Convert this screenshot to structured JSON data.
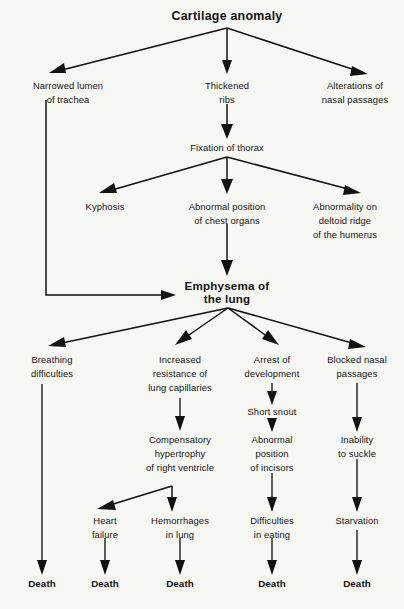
{
  "diagram": {
    "title": "Cartilage anomaly",
    "type": "flowchart",
    "orientation": "top-down",
    "background_color": "#f7f7f4",
    "line_color": "#121212",
    "text_color": "#121212",
    "nodes": [
      {
        "id": "cartilage_anomaly",
        "label": "Cartilage anomaly",
        "lines": [
          "Cartilage anomaly"
        ],
        "style": "bold-title",
        "x": 227,
        "y": 16,
        "level": 0
      },
      {
        "id": "narrowed_lumen",
        "label": "Narrowed lumen of trachea",
        "lines": [
          "Narrowed lumen",
          "of trachea"
        ],
        "style": "plain",
        "x": 68,
        "y": 86,
        "level": 1
      },
      {
        "id": "thickened_ribs",
        "label": "Thickened ribs",
        "lines": [
          "Thickened",
          "ribs"
        ],
        "style": "plain",
        "x": 227,
        "y": 86,
        "level": 1
      },
      {
        "id": "alterations_nasal",
        "label": "Alterations of nasal passages",
        "lines": [
          "Alterations of",
          "nasal passages"
        ],
        "style": "plain",
        "x": 355,
        "y": 86,
        "level": 1
      },
      {
        "id": "fixation_thorax",
        "label": "Fixation of thorax",
        "lines": [
          "Fixation of thorax"
        ],
        "style": "plain",
        "x": 227,
        "y": 148,
        "level": 2
      },
      {
        "id": "kyphosis",
        "label": "Kyphosis",
        "lines": [
          "Kyphosis"
        ],
        "style": "plain",
        "x": 105,
        "y": 207,
        "level": 3
      },
      {
        "id": "abnormal_position_chest",
        "label": "Abnormal position of chest organs",
        "lines": [
          "Abnormal position",
          "of chest organs"
        ],
        "style": "plain",
        "x": 227,
        "y": 207,
        "level": 3
      },
      {
        "id": "abnormality_deltoid",
        "label": "Abnormality on deltoid ridge of the humerus",
        "lines": [
          "Abnormality on",
          "deltoid ridge",
          "of the humerus"
        ],
        "style": "plain",
        "x": 345,
        "y": 207,
        "level": 3
      },
      {
        "id": "emphysema_lung",
        "label": "Emphysema of the lung",
        "lines": [
          "Emphysema of",
          "the lung"
        ],
        "style": "bold",
        "x": 227,
        "y": 286,
        "level": 4
      },
      {
        "id": "breathing_difficulties",
        "label": "Breathing difficulties",
        "lines": [
          "Breathing",
          "difficulties"
        ],
        "style": "plain",
        "x": 52,
        "y": 360,
        "level": 5
      },
      {
        "id": "increased_resistance",
        "label": "Increased resistance of lung capillaries",
        "lines": [
          "Increased",
          "resistance of",
          "lung capillaries"
        ],
        "style": "plain",
        "x": 180,
        "y": 360,
        "level": 5
      },
      {
        "id": "arrest_development",
        "label": "Arrest of development",
        "lines": [
          "Arrest of",
          "development"
        ],
        "style": "plain",
        "x": 272,
        "y": 360,
        "level": 5
      },
      {
        "id": "blocked_nasal",
        "label": "Blocked nasal passages",
        "lines": [
          "Blocked nasal",
          "passages"
        ],
        "style": "plain",
        "x": 357,
        "y": 360,
        "level": 5
      },
      {
        "id": "short_snout",
        "label": "Short snout",
        "lines": [
          "Short snout"
        ],
        "style": "plain",
        "x": 272,
        "y": 412,
        "level": 6
      },
      {
        "id": "compensatory_hypertrophy",
        "label": "Compensatory hypertrophy of right ventricle",
        "lines": [
          "Compensatory",
          "hypertrophy",
          "of right ventricle"
        ],
        "style": "plain",
        "x": 180,
        "y": 440,
        "level": 7
      },
      {
        "id": "abnormal_position_incisors",
        "label": "Abnormal position of incisors",
        "lines": [
          "Abnormal",
          "position",
          "of incisors"
        ],
        "style": "plain",
        "x": 272,
        "y": 440,
        "level": 7
      },
      {
        "id": "inability_suckle",
        "label": "Inability to suckle",
        "lines": [
          "Inability",
          "to suckle"
        ],
        "style": "plain",
        "x": 357,
        "y": 440,
        "level": 7
      },
      {
        "id": "heart_failure",
        "label": "Heart failure",
        "lines": [
          "Heart",
          "failure"
        ],
        "style": "plain",
        "x": 105,
        "y": 521,
        "level": 8
      },
      {
        "id": "hemorrhages_lung",
        "label": "Hemorrhages in lung",
        "lines": [
          "Hemorrhages",
          "in lung"
        ],
        "style": "plain",
        "x": 180,
        "y": 521,
        "level": 8
      },
      {
        "id": "difficulties_eating",
        "label": "Difficulties in eating",
        "lines": [
          "Difficulties",
          "in eating"
        ],
        "style": "plain",
        "x": 272,
        "y": 521,
        "level": 8
      },
      {
        "id": "starvation",
        "label": "Starvation",
        "lines": [
          "Starvation"
        ],
        "style": "plain",
        "x": 357,
        "y": 521,
        "level": 8
      },
      {
        "id": "death_1",
        "label": "Death",
        "lines": [
          "Death"
        ],
        "style": "bold-small",
        "x": 42,
        "y": 583,
        "level": 9
      },
      {
        "id": "death_2",
        "label": "Death",
        "lines": [
          "Death"
        ],
        "style": "bold-small",
        "x": 105,
        "y": 583,
        "level": 9
      },
      {
        "id": "death_3",
        "label": "Death",
        "lines": [
          "Death"
        ],
        "style": "bold-small",
        "x": 180,
        "y": 583,
        "level": 9
      },
      {
        "id": "death_4",
        "label": "Death",
        "lines": [
          "Death"
        ],
        "style": "bold-small",
        "x": 272,
        "y": 583,
        "level": 9
      },
      {
        "id": "death_5",
        "label": "Death",
        "lines": [
          "Death"
        ],
        "style": "bold-small",
        "x": 357,
        "y": 583,
        "level": 9
      }
    ],
    "edges": [
      {
        "from": "cartilage_anomaly",
        "to": "narrowed_lumen"
      },
      {
        "from": "cartilage_anomaly",
        "to": "thickened_ribs"
      },
      {
        "from": "cartilage_anomaly",
        "to": "alterations_nasal"
      },
      {
        "from": "thickened_ribs",
        "to": "fixation_thorax"
      },
      {
        "from": "narrowed_lumen",
        "to": "emphysema_lung",
        "routing": "elbow-left"
      },
      {
        "from": "fixation_thorax",
        "to": "kyphosis"
      },
      {
        "from": "fixation_thorax",
        "to": "abnormal_position_chest"
      },
      {
        "from": "fixation_thorax",
        "to": "abnormality_deltoid"
      },
      {
        "from": "abnormal_position_chest",
        "to": "emphysema_lung"
      },
      {
        "from": "emphysema_lung",
        "to": "breathing_difficulties"
      },
      {
        "from": "emphysema_lung",
        "to": "increased_resistance"
      },
      {
        "from": "emphysema_lung",
        "to": "arrest_development"
      },
      {
        "from": "emphysema_lung",
        "to": "blocked_nasal"
      },
      {
        "from": "breathing_difficulties",
        "to": "death_1"
      },
      {
        "from": "increased_resistance",
        "to": "compensatory_hypertrophy"
      },
      {
        "from": "arrest_development",
        "to": "short_snout"
      },
      {
        "from": "short_snout",
        "to": "abnormal_position_incisors"
      },
      {
        "from": "blocked_nasal",
        "to": "inability_suckle"
      },
      {
        "from": "compensatory_hypertrophy",
        "to": "heart_failure"
      },
      {
        "from": "compensatory_hypertrophy",
        "to": "hemorrhages_lung"
      },
      {
        "from": "abnormal_position_incisors",
        "to": "difficulties_eating"
      },
      {
        "from": "inability_suckle",
        "to": "starvation"
      },
      {
        "from": "heart_failure",
        "to": "death_2"
      },
      {
        "from": "hemorrhages_lung",
        "to": "death_3"
      },
      {
        "from": "difficulties_eating",
        "to": "death_4"
      },
      {
        "from": "starvation",
        "to": "death_5"
      }
    ]
  }
}
